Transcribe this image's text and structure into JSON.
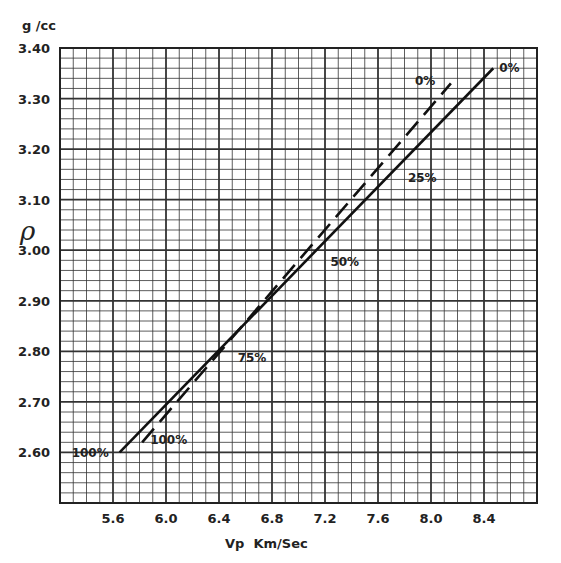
{
  "chart_data": {
    "type": "line",
    "title": "",
    "xlabel": "Vp  Km/Sec",
    "ylabel": "ρ",
    "y_unit": "g /cc",
    "xlim": [
      5.2,
      8.8
    ],
    "ylim": [
      2.5,
      3.4
    ],
    "x_ticks": [
      5.6,
      6.0,
      6.4,
      6.8,
      7.2,
      7.6,
      8.0,
      8.4
    ],
    "x_tick_labels": [
      "5.6",
      "6.0",
      "6.4",
      "6.8",
      "7.2",
      "7.6",
      "8.0",
      "8.4"
    ],
    "y_ticks": [
      2.6,
      2.7,
      2.8,
      2.9,
      3.0,
      3.1,
      3.2,
      3.3,
      3.4
    ],
    "y_tick_labels": [
      "2.60",
      "2.70",
      "2.80",
      "2.90",
      "3.00",
      "3.10",
      "3.20",
      "3.30",
      "3.40"
    ],
    "grid": true,
    "series": [
      {
        "name": "solid",
        "style": "solid",
        "x": [
          5.65,
          8.47
        ],
        "y": [
          2.6,
          3.36
        ],
        "annotations": [
          {
            "text": "100%",
            "x": 5.65,
            "y": 2.6
          },
          {
            "text": "75%",
            "x": 6.45,
            "y": 2.79
          },
          {
            "text": "50%",
            "x": 7.15,
            "y": 2.98
          },
          {
            "text": "25%",
            "x": 7.75,
            "y": 3.15
          },
          {
            "text": "0%",
            "x": 8.47,
            "y": 3.36
          }
        ]
      },
      {
        "name": "dashed",
        "style": "dashed",
        "x": [
          5.82,
          8.15
        ],
        "y": [
          2.62,
          3.33
        ],
        "annotations": [
          {
            "text": "100%",
            "x": 5.82,
            "y": 2.62
          },
          {
            "text": "0%",
            "x": 8.15,
            "y": 3.33
          }
        ]
      }
    ]
  }
}
